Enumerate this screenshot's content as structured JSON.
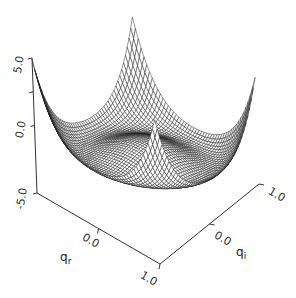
{
  "chart_data": {
    "type": "surface",
    "title": "",
    "xlabel": "q_r",
    "ylabel": "q_i",
    "zlabel": "",
    "xlim": [
      -1.0,
      1.0
    ],
    "ylim": [
      -1.0,
      1.0
    ],
    "zlim": [
      -5.0,
      5.0
    ],
    "x_ticks": [
      "0.0",
      "1.0"
    ],
    "y_ticks": [
      "1.0",
      "0.0",
      "1.0"
    ],
    "z_ticks": [
      "5.0",
      "0.0",
      "-5.0"
    ],
    "mesh_resolution": 48,
    "surface_model": {
      "formula": "z = a*r^4 - b*r^2 + c + lx*q_r + ly*q_i, r^2 = q_r^2 + q_i^2",
      "a": 3.375,
      "b": 4.05,
      "c": -1.5,
      "lx": 0.4,
      "ly": -1.4
    },
    "approx_corner_heights": {
      "q_r=-1,q_i=-1": 4.9,
      "q_r=-1,q_i=1": 2.1,
      "q_r=1,q_i=1": 2.9,
      "center": -1.5,
      "valley_min": -2.7
    },
    "grid": false,
    "legend": null,
    "line_color": "#1a1a1a"
  },
  "labels": {
    "z_top": "5.0",
    "z_mid": "0.0",
    "z_bottom": "-5.0",
    "qr_mid": "0.0",
    "qr_end": "1.0",
    "qi_start": "1.0",
    "qi_mid": "0.0",
    "qi_end": "1.0",
    "qr_name": "q",
    "qr_sub": "r",
    "qi_name": "q",
    "qi_sub": "i"
  }
}
